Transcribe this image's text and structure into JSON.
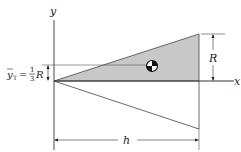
{
  "diagram": {
    "colors": {
      "line": "#333333",
      "shade": "#c8c8c8",
      "background": "#ffffff"
    },
    "axes": {
      "x_label": "x",
      "y_label": "y"
    },
    "labels": {
      "ybar": "y",
      "ybar_sub": "T",
      "equals": "=",
      "frac_num": "1",
      "frac_den": "3",
      "frac_var": "R",
      "R_dim": "R",
      "h_dim": "h"
    },
    "shapes": {
      "upper_triangle": "shaded",
      "lower_triangle": "outline",
      "centroid_symbol": "centroid-marker"
    }
  }
}
